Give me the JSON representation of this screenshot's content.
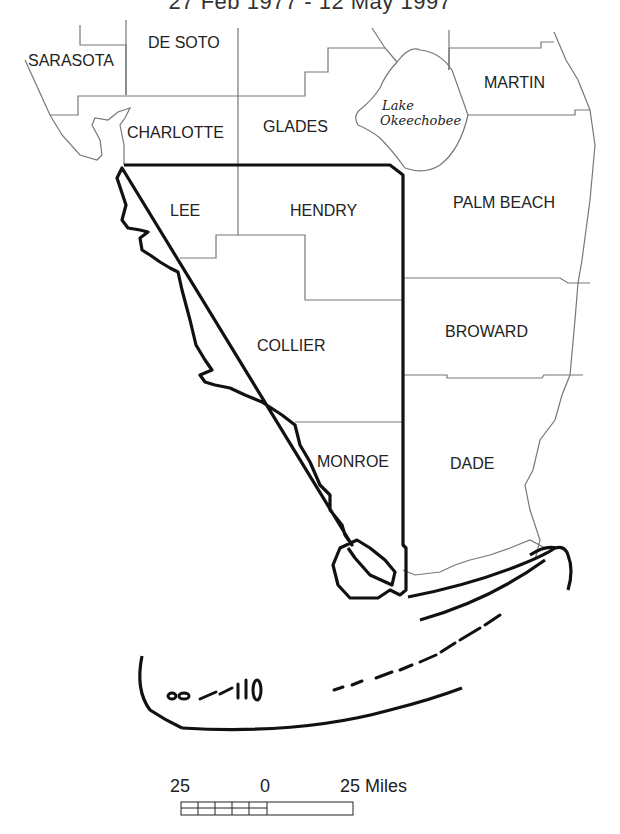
{
  "title": "27 Feb 1977 - 12 May 1997",
  "counties": [
    {
      "name": "SARASOTA",
      "x": 28,
      "y": 52
    },
    {
      "name": "DE SOTO",
      "x": 148,
      "y": 35
    },
    {
      "name": "MARTIN",
      "x": 484,
      "y": 75
    },
    {
      "name": "CHARLOTTE",
      "x": 127,
      "y": 124
    },
    {
      "name": "GLADES",
      "x": 263,
      "y": 118
    },
    {
      "name": "LEE",
      "x": 170,
      "y": 202
    },
    {
      "name": "HENDRY",
      "x": 290,
      "y": 202
    },
    {
      "name": "PALM BEACH",
      "x": 453,
      "y": 194
    },
    {
      "name": "COLLIER",
      "x": 257,
      "y": 337
    },
    {
      "name": "BROWARD",
      "x": 445,
      "y": 323
    },
    {
      "name": "MONROE",
      "x": 317,
      "y": 453
    },
    {
      "name": "DADE",
      "x": 450,
      "y": 455
    }
  ],
  "lake": {
    "line1": "Lake",
    "line2": "Okeechobee"
  },
  "scale_bar": {
    "left": "25",
    "center": "0",
    "right": "25 Miles"
  },
  "colors": {
    "outline": "#111111",
    "county_border": "#777777",
    "background": "#ffffff"
  }
}
